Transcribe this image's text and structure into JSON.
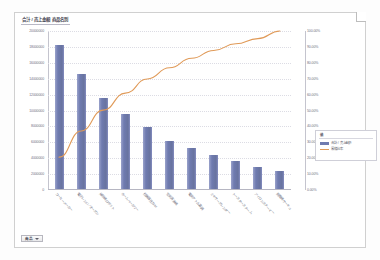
{
  "chart": {
    "title": "合計 / 売上金額  商品名別",
    "legend_title": "値",
    "filter_button": {
      "label": "商品",
      "caret_icon": "chevron-down-icon"
    }
  },
  "chart_data": {
    "type": "bar",
    "title": "合計 / 売上金額  商品名別",
    "xlabel": "",
    "ylabel": "合計 / 売上金額",
    "y2label": "累積比率",
    "ylim": [
      0,
      20000000
    ],
    "y2lim": [
      0,
      1.0
    ],
    "grid": true,
    "legend_position": "right",
    "categories": [
      "コーヒーメーカー",
      "電子レンジ／オーブン",
      "掃除機 ロボット",
      "ホームベーカリー",
      "炊飯器 圧力IH",
      "空気清浄機",
      "電気ケトル 温調",
      "ミキサー ブレンダー",
      "トースター スチーム",
      "アイロン スチーマー",
      "扇風機 サーキュ"
    ],
    "y_tick_labels": [
      "20000000",
      "18000000",
      "16000000",
      "14000000",
      "12000000",
      "10000000",
      "8000000",
      "6000000",
      "4000000",
      "2000000",
      "0"
    ],
    "y2_tick_labels": [
      "100.00%",
      "90.00%",
      "80.00%",
      "70.00%",
      "60.00%",
      "50.00%",
      "40.00%",
      "30.00%",
      "20.00%",
      "10.00%",
      "0.00%"
    ],
    "series": [
      {
        "name": "合計 / 売上金額",
        "type": "bar",
        "color": "#6F7BB0",
        "axis": "left",
        "values": [
          18300000,
          14600000,
          11600000,
          9500000,
          7900000,
          6200000,
          5300000,
          4400000,
          3700000,
          2900000,
          2400000
        ]
      },
      {
        "name": "累積比率",
        "type": "line",
        "color": "#E09A58",
        "axis": "right",
        "values": [
          0.2065,
          0.3712,
          0.5021,
          0.6093,
          0.6984,
          0.7684,
          0.8282,
          0.8778,
          0.9196,
          0.9523,
          1.0
        ]
      }
    ]
  }
}
